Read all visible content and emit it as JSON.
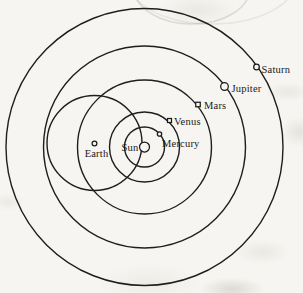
{
  "figure": {
    "description_labels": [
      "Sun",
      "Mercury",
      "Venus",
      "Earth",
      "Mars",
      "Jupiter",
      "Saturn"
    ]
  },
  "colors": {
    "paper": "#f6f5f1",
    "ink": "#1e1e1e"
  },
  "diagram": {
    "canvas": {
      "width": 303,
      "height": 293
    },
    "center": {
      "x": 144.5,
      "y": 147
    },
    "orbits": [
      {
        "name": "mercury-orbit",
        "cx": 144.5,
        "cy": 147,
        "r": 20
      },
      {
        "name": "venus-orbit",
        "cx": 144.5,
        "cy": 147,
        "r": 35
      },
      {
        "name": "mars-orbit",
        "cx": 144.5,
        "cy": 147,
        "r": 67
      },
      {
        "name": "jupiter-orbit",
        "cx": 144.5,
        "cy": 147,
        "r": 101
      },
      {
        "name": "saturn-orbit",
        "cx": 144.5,
        "cy": 147,
        "r": 138.5
      },
      {
        "name": "earth-circle",
        "cx": 94.5,
        "cy": 143,
        "r": 47.5
      }
    ],
    "bodies": [
      {
        "name": "sun",
        "label": "Sun",
        "marker": "circle",
        "x": 144.5,
        "y": 147,
        "r": 5,
        "label_x": 138.5,
        "label_y": 150.5,
        "anchor": "end"
      },
      {
        "name": "mercury",
        "label": "Mercury",
        "marker": "circle",
        "x": 159.5,
        "y": 134,
        "r": 2.2,
        "label_x": 162,
        "label_y": 147,
        "anchor": "start"
      },
      {
        "name": "venus",
        "label": "Venus",
        "marker": "square",
        "x": 169.5,
        "y": 120.5,
        "size": 4,
        "label_x": 174,
        "label_y": 124.5,
        "anchor": "start"
      },
      {
        "name": "earth",
        "label": "Earth",
        "marker": "circle",
        "x": 94.5,
        "y": 143.5,
        "r": 2.4,
        "label_x": 96.5,
        "label_y": 156.5,
        "anchor": "middle"
      },
      {
        "name": "mars",
        "label": "Mars",
        "marker": "square",
        "x": 198,
        "y": 104.5,
        "size": 4.5,
        "label_x": 204,
        "label_y": 109,
        "anchor": "start"
      },
      {
        "name": "jupiter",
        "label": "Jupiter",
        "marker": "circle",
        "x": 224.5,
        "y": 86.5,
        "r": 3.8,
        "label_x": 231.5,
        "label_y": 91.5,
        "anchor": "start"
      },
      {
        "name": "saturn",
        "label": "Saturn",
        "marker": "circle",
        "x": 256.5,
        "y": 67,
        "r": 2.8,
        "label_x": 261.5,
        "label_y": 73,
        "anchor": "start"
      }
    ]
  }
}
